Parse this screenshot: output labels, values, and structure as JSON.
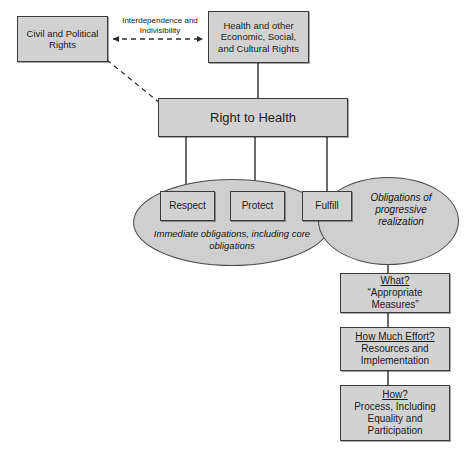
{
  "diagram": {
    "colors": {
      "node_fill": "#d2d2d2",
      "node_border": "#3b3b3b",
      "ellipse_fill": "#cfcfcf",
      "ellipse_border": "#4a4a4a",
      "line": "#2b2b2b",
      "background": "#ffffff"
    },
    "nodes": {
      "civil_political": "Civil and Political Rights",
      "health_other": "Health and other Economic, Social, and Cultural Rights",
      "right_to_health": "Right to Health",
      "respect": "Respect",
      "protect": "Protect",
      "fulfill": "Fulfill"
    },
    "ellipses": {
      "immediate": "Immediate obligations, including core obligations",
      "progressive": "Obligations of progressive realization"
    },
    "edge_labels": {
      "interdependence": "Interdependence and Indivisibility"
    },
    "question_boxes": [
      {
        "heading": "What?",
        "body": "“Appropriate Measures”"
      },
      {
        "heading": "How Much Effort?",
        "body": "Resources and Implementation"
      },
      {
        "heading": "How?",
        "body": "Process, Including Equality and Participation"
      }
    ]
  }
}
